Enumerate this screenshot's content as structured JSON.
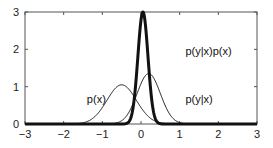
{
  "chart_data": {
    "type": "line",
    "title": "",
    "xlabel": "",
    "ylabel": "",
    "xlim": [
      -3,
      3
    ],
    "ylim": [
      0,
      3
    ],
    "xticks": [
      -3,
      -2,
      -1,
      0,
      1,
      2,
      3
    ],
    "yticks": [
      0,
      1,
      2,
      3
    ],
    "grid": false,
    "legend": "none",
    "series": [
      {
        "name": "p(x)",
        "kind": "gaussian",
        "mean": -0.5,
        "peak": 1.05,
        "sigma": 0.38,
        "line_width": 1,
        "label_pos": [
          -1.4,
          0.55
        ]
      },
      {
        "name": "p(y|x)",
        "kind": "gaussian",
        "mean": 0.2,
        "peak": 1.35,
        "sigma": 0.3,
        "line_width": 1,
        "label_pos": [
          1.15,
          0.55
        ]
      },
      {
        "name": "p(y|x)p(x)",
        "kind": "gaussian",
        "mean": 0.05,
        "peak": 3.0,
        "sigma": 0.13,
        "line_width": 3,
        "label_pos": [
          1.15,
          1.85
        ]
      }
    ],
    "annotations": [
      "p(x)",
      "p(y|x)",
      "p(y|x)p(x)"
    ]
  },
  "labels": {
    "px": "p(x)",
    "pyx": "p(y|x)",
    "posterior": "p(y|x)p(x)"
  }
}
